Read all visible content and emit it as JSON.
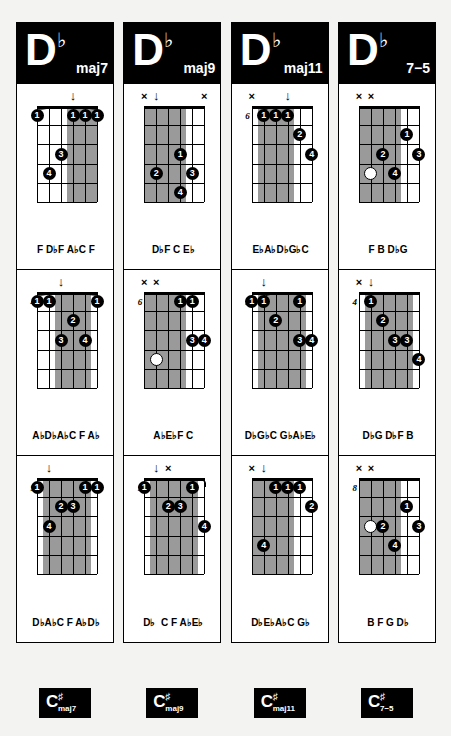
{
  "instrument": "guitar",
  "strings": 6,
  "frets_per_diagram": 5,
  "colors": {
    "ink": "#000000",
    "paper": "#ffffff",
    "page_background": "#f3f3f1",
    "muted_shade": "#9a9a9a",
    "dot_fill": "#000000",
    "dot_text": "#ffffff"
  },
  "glyphs": {
    "flat": "♭",
    "sharp": "♯",
    "mute": "×",
    "down_arrow": "↓",
    "left_arrow": "◂"
  },
  "columns": [
    {
      "header": {
        "root": "D",
        "accidental": "♭",
        "quality": "maj7"
      },
      "footer": {
        "root": "C",
        "accidental": "♯",
        "quality": "maj7"
      },
      "voicings": [
        {
          "position_label": "",
          "notes": "F D♭F A♭C F",
          "top_marks": [
            {
              "string": 3,
              "symbol": "↓"
            }
          ],
          "shaded_strings": [
            1,
            2,
            3
          ],
          "barre": {
            "fret": 1,
            "from_string": 1,
            "to_string": 6
          },
          "dots": [
            {
              "string": 6,
              "fret": 1,
              "finger": "1"
            },
            {
              "string": 3,
              "fret": 1,
              "finger": "1"
            },
            {
              "string": 2,
              "fret": 1,
              "finger": "1"
            },
            {
              "string": 1,
              "fret": 1,
              "finger": "1"
            },
            {
              "string": 4,
              "fret": 3,
              "finger": "3"
            },
            {
              "string": 5,
              "fret": 4,
              "finger": "4"
            }
          ]
        },
        {
          "position_label": "4",
          "notes": "A♭D♭A♭C F A♭",
          "top_marks": [
            {
              "string": 4,
              "symbol": "↓"
            }
          ],
          "shaded_strings": [
            2,
            3,
            4
          ],
          "barre": {
            "fret": 1,
            "from_string": 6,
            "to_string": 1
          },
          "dots": [
            {
              "string": 6,
              "fret": 1,
              "finger": "1"
            },
            {
              "string": 5,
              "fret": 1,
              "finger": "1"
            },
            {
              "string": 1,
              "fret": 1,
              "finger": "1"
            },
            {
              "string": 3,
              "fret": 2,
              "finger": "2"
            },
            {
              "string": 4,
              "fret": 3,
              "finger": "3"
            },
            {
              "string": 2,
              "fret": 3,
              "finger": "4"
            }
          ]
        },
        {
          "position_label": "9",
          "notes": "D♭A♭C F A♭D♭",
          "top_marks": [
            {
              "string": 5,
              "symbol": "↓"
            }
          ],
          "shaded_strings": [
            2,
            3,
            4,
            5
          ],
          "barre": {
            "fret": 1,
            "from_string": 2,
            "to_string": 1
          },
          "dots": [
            {
              "string": 6,
              "fret": 1,
              "finger": "1"
            },
            {
              "string": 2,
              "fret": 1,
              "finger": "1"
            },
            {
              "string": 1,
              "fret": 1,
              "finger": "1"
            },
            {
              "string": 4,
              "fret": 2,
              "finger": "2"
            },
            {
              "string": 3,
              "fret": 2,
              "finger": "3"
            },
            {
              "string": 5,
              "fret": 3,
              "finger": "4"
            }
          ]
        }
      ]
    },
    {
      "header": {
        "root": "D",
        "accidental": "♭",
        "quality": "maj9"
      },
      "footer": {
        "root": "C",
        "accidental": "♯",
        "quality": "maj9"
      },
      "voicings": [
        {
          "position_label": "",
          "notes": "D♭F C E♭",
          "top_marks": [
            {
              "string": 6,
              "symbol": "×"
            },
            {
              "string": 5,
              "symbol": "↓"
            },
            {
              "string": 1,
              "symbol": "×"
            }
          ],
          "shaded_strings": [
            3,
            4,
            5,
            6
          ],
          "barre": null,
          "dots": [
            {
              "string": 3,
              "fret": 3,
              "finger": "1"
            },
            {
              "string": 5,
              "fret": 4,
              "finger": "2"
            },
            {
              "string": 2,
              "fret": 4,
              "finger": "3"
            },
            {
              "string": 3,
              "fret": 5,
              "finger": "4"
            }
          ]
        },
        {
          "position_label": "6",
          "notes": "A♭E♭F C",
          "top_marks": [
            {
              "string": 6,
              "symbol": "×"
            },
            {
              "string": 5,
              "symbol": "×"
            }
          ],
          "shaded_strings": [
            3,
            4,
            5,
            6
          ],
          "barre": null,
          "dots": [
            {
              "string": 3,
              "fret": 1,
              "finger": "1"
            },
            {
              "string": 2,
              "fret": 1,
              "finger": "1"
            },
            {
              "string": 2,
              "fret": 3,
              "finger": "3"
            },
            {
              "string": 1,
              "fret": 3,
              "finger": "4"
            },
            {
              "string": 5,
              "fret": 4,
              "finger": "",
              "open": true
            }
          ]
        },
        {
          "position_label": "9",
          "notes": "D♭  C F A♭E♭",
          "top_marks": [
            {
              "string": 5,
              "symbol": "↓"
            },
            {
              "string": 4,
              "symbol": "×"
            }
          ],
          "shaded_strings": [
            2,
            3,
            4,
            5
          ],
          "barre": {
            "fret": 1,
            "from_string": 2,
            "to_string": 1
          },
          "dots": [
            {
              "string": 6,
              "fret": 1,
              "finger": "1"
            },
            {
              "string": 2,
              "fret": 1,
              "finger": "1"
            },
            {
              "string": 4,
              "fret": 2,
              "finger": "2"
            },
            {
              "string": 3,
              "fret": 2,
              "finger": "3"
            },
            {
              "string": 1,
              "fret": 3,
              "finger": "4"
            }
          ]
        }
      ]
    },
    {
      "header": {
        "root": "D",
        "accidental": "♭",
        "quality": "maj11"
      },
      "footer": {
        "root": "C",
        "accidental": "♯",
        "quality": "maj11"
      },
      "voicings": [
        {
          "position_label": "6",
          "notes": "E♭A♭D♭G♭C",
          "top_marks": [
            {
              "string": 6,
              "symbol": "×"
            },
            {
              "string": 3,
              "symbol": "↓"
            }
          ],
          "shaded_strings": [
            3,
            4,
            5
          ],
          "barre": {
            "fret": 1,
            "from_string": 5,
            "to_string": 3
          },
          "dots": [
            {
              "string": 5,
              "fret": 1,
              "finger": "1"
            },
            {
              "string": 4,
              "fret": 1,
              "finger": "1"
            },
            {
              "string": 3,
              "fret": 1,
              "finger": "1"
            },
            {
              "string": 2,
              "fret": 2,
              "finger": "2"
            },
            {
              "string": 1,
              "fret": 3,
              "finger": "4"
            }
          ]
        },
        {
          "position_label": "9",
          "notes": "D♭G♭C G♭A♭E♭",
          "top_marks": [
            {
              "string": 5,
              "symbol": "↓"
            }
          ],
          "shaded_strings": [
            2,
            3,
            4,
            5
          ],
          "barre": {
            "fret": 1,
            "from_string": 5,
            "to_string": 2
          },
          "dots": [
            {
              "string": 6,
              "fret": 1,
              "finger": "1"
            },
            {
              "string": 5,
              "fret": 1,
              "finger": "1"
            },
            {
              "string": 2,
              "fret": 1,
              "finger": "1"
            },
            {
              "string": 4,
              "fret": 2,
              "finger": "2"
            },
            {
              "string": 2,
              "fret": 3,
              "finger": "3"
            },
            {
              "string": 1,
              "fret": 3,
              "finger": "4"
            }
          ]
        },
        {
          "position_label": "",
          "notes": "D♭E♭A♭C G♭",
          "top_marks": [
            {
              "string": 6,
              "symbol": "×"
            },
            {
              "string": 5,
              "symbol": "↓"
            }
          ],
          "shaded_strings": [
            3,
            4,
            5,
            6
          ],
          "barre": {
            "fret": 1,
            "from_string": 4,
            "to_string": 2
          },
          "dots": [
            {
              "string": 4,
              "fret": 1,
              "finger": "1"
            },
            {
              "string": 3,
              "fret": 1,
              "finger": "1"
            },
            {
              "string": 2,
              "fret": 1,
              "finger": "1"
            },
            {
              "string": 1,
              "fret": 2,
              "finger": "2"
            },
            {
              "string": 5,
              "fret": 4,
              "finger": "4"
            }
          ]
        }
      ]
    },
    {
      "header": {
        "root": "D",
        "accidental": "♭",
        "quality": "7−5"
      },
      "footer": {
        "root": "C",
        "accidental": "♯",
        "quality": "7−5"
      },
      "voicings": [
        {
          "position_label": "",
          "notes": "F B D♭G",
          "top_marks": [
            {
              "string": 6,
              "symbol": "×"
            },
            {
              "string": 5,
              "symbol": "×"
            }
          ],
          "shaded_strings": [
            3,
            4,
            5,
            6
          ],
          "barre": null,
          "dots": [
            {
              "string": 2,
              "fret": 2,
              "finger": "1"
            },
            {
              "string": 4,
              "fret": 3,
              "finger": "2"
            },
            {
              "string": 1,
              "fret": 3,
              "finger": "3"
            },
            {
              "string": 5,
              "fret": 4,
              "finger": "",
              "open": true
            },
            {
              "string": 3,
              "fret": 4,
              "finger": "4"
            }
          ]
        },
        {
          "position_label": "4",
          "notes": "D♭G D♭F B",
          "top_marks": [
            {
              "string": 6,
              "symbol": "×"
            },
            {
              "string": 5,
              "symbol": "↓"
            }
          ],
          "shaded_strings": [
            2,
            3,
            4,
            5
          ],
          "barre": null,
          "dots": [
            {
              "string": 5,
              "fret": 1,
              "finger": "1"
            },
            {
              "string": 4,
              "fret": 2,
              "finger": "2"
            },
            {
              "string": 3,
              "fret": 3,
              "finger": "3"
            },
            {
              "string": 2,
              "fret": 3,
              "finger": "3"
            },
            {
              "string": 1,
              "fret": 4,
              "finger": "4"
            }
          ]
        },
        {
          "position_label": "8",
          "notes": "B F G D♭",
          "top_marks": [
            {
              "string": 6,
              "symbol": "×"
            },
            {
              "string": 5,
              "symbol": "×"
            }
          ],
          "shaded_strings": [
            3,
            4,
            5,
            6
          ],
          "barre": null,
          "dots": [
            {
              "string": 2,
              "fret": 2,
              "finger": "1"
            },
            {
              "string": 5,
              "fret": 3,
              "finger": "",
              "open": true
            },
            {
              "string": 4,
              "fret": 3,
              "finger": "2"
            },
            {
              "string": 1,
              "fret": 3,
              "finger": "3"
            },
            {
              "string": 3,
              "fret": 4,
              "finger": "4"
            }
          ]
        }
      ]
    }
  ]
}
